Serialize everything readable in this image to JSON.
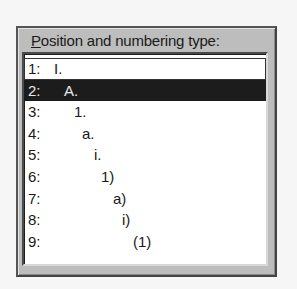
{
  "group": {
    "label_accel": "P",
    "label_rest": "osition and numbering type:"
  },
  "list": {
    "selected_index": 1,
    "items": [
      {
        "number": "1:",
        "format": "I.",
        "indent_px": 30
      },
      {
        "number": "2:",
        "format": "A.",
        "indent_px": 40
      },
      {
        "number": "3:",
        "format": "1.",
        "indent_px": 50
      },
      {
        "number": "4:",
        "format": "a.",
        "indent_px": 58
      },
      {
        "number": "5:",
        "format": "i.",
        "indent_px": 70
      },
      {
        "number": "6:",
        "format": "1)",
        "indent_px": 77
      },
      {
        "number": "7:",
        "format": "a)",
        "indent_px": 89
      },
      {
        "number": "8:",
        "format": "i)",
        "indent_px": 98
      },
      {
        "number": "9:",
        "format": "(1)",
        "indent_px": 109
      }
    ]
  },
  "colors": {
    "panel_bg": "#bdbdbd",
    "list_bg": "#ffffff",
    "selection_bg": "#1c1c1c",
    "selection_fg": "#e8e8e8"
  }
}
